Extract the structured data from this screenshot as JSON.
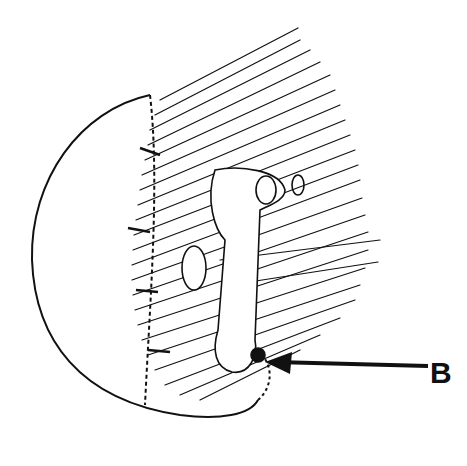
{
  "figure": {
    "type": "anatomical-line-illustration",
    "labels": [
      {
        "id": "B",
        "text": "B",
        "pointer": "arrow pointing left to small dark structure near lower pouch"
      }
    ]
  }
}
